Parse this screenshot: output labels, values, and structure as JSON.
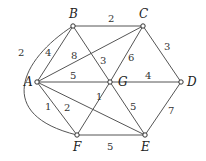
{
  "graph": {
    "nodes": [
      {
        "id": "A",
        "label": "A"
      },
      {
        "id": "B",
        "label": "B"
      },
      {
        "id": "C",
        "label": "C"
      },
      {
        "id": "D",
        "label": "D"
      },
      {
        "id": "E",
        "label": "E"
      },
      {
        "id": "F",
        "label": "F"
      },
      {
        "id": "G",
        "label": "G"
      }
    ],
    "edges": [
      {
        "from": "B",
        "to": "C",
        "weight": "2"
      },
      {
        "from": "C",
        "to": "D",
        "weight": "3"
      },
      {
        "from": "D",
        "to": "E",
        "weight": "7"
      },
      {
        "from": "E",
        "to": "F",
        "weight": "5"
      },
      {
        "from": "A",
        "to": "F",
        "weight": "1"
      },
      {
        "from": "A",
        "to": "B",
        "weight": "4"
      },
      {
        "from": "A",
        "to": "C",
        "weight": "8"
      },
      {
        "from": "B",
        "to": "G",
        "weight": "3"
      },
      {
        "from": "C",
        "to": "G",
        "weight": "6"
      },
      {
        "from": "A",
        "to": "G",
        "weight": "5"
      },
      {
        "from": "G",
        "to": "D",
        "weight": "4"
      },
      {
        "from": "G",
        "to": "E",
        "weight": "5"
      },
      {
        "from": "G",
        "to": "F",
        "weight": "1"
      },
      {
        "from": "A",
        "to": "E",
        "weight": "2"
      },
      {
        "from": "B",
        "to": "F",
        "weight": "2",
        "curved": true
      }
    ]
  }
}
